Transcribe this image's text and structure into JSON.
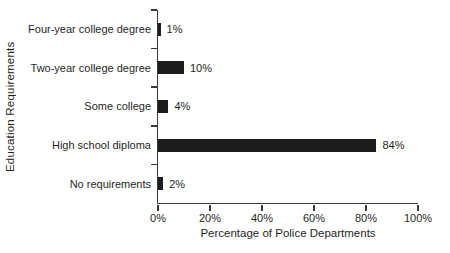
{
  "chart_data": {
    "type": "bar",
    "orientation": "horizontal",
    "title": "",
    "xlabel": "Percentage of Police Departments",
    "ylabel": "Education Requirements",
    "categories": [
      "Four-year college degree",
      "Two-year college degree",
      "Some college",
      "High school diploma",
      "No requirements"
    ],
    "values": [
      1,
      10,
      4,
      84,
      2
    ],
    "value_labels": [
      "1%",
      "10%",
      "4%",
      "84%",
      "2%"
    ],
    "xlim": [
      0,
      100
    ],
    "x_ticks": [
      0,
      20,
      40,
      60,
      80,
      100
    ],
    "x_tick_labels": [
      "0%",
      "20%",
      "40%",
      "60%",
      "80%",
      "100%"
    ],
    "grid": false,
    "legend": false,
    "bar_color": "#1c1c1c",
    "axis_color": "#3a3a3a",
    "text_color": "#1f1f1f",
    "background_color": "#ffffff"
  }
}
